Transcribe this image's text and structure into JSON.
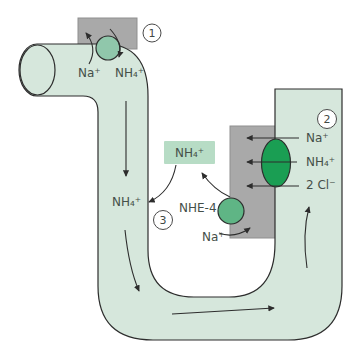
{
  "colors": {
    "tubule_fill": "#d6e7dc",
    "membrane_gray": "#a9a9a9",
    "nh4_box_fill": "#b7dcc5",
    "step1_transporter_fill": "#90c7ab",
    "step2_transporter_fill": "#1a9e53",
    "nhe4_transporter_fill": "#5fb585",
    "outline": "#2d2d2d",
    "text": "#454f49"
  },
  "step1": {
    "badge": "1",
    "na_label": "Na⁺",
    "nh4_label": "NH₄⁺"
  },
  "step2": {
    "badge": "2",
    "na_label": "Na⁺",
    "nh4_label": "NH₄⁺",
    "cl_label": "2 Cl⁻"
  },
  "step3": {
    "badge": "3",
    "nh4_box_label": "NH₄⁺",
    "lumen_nh4_label": "NH₄⁺",
    "transporter_label": "NHE-4",
    "na_label": "Na⁺"
  }
}
